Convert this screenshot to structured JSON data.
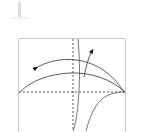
{
  "figure": {
    "name": "phase-plane-trajectory-diagram",
    "background_color": "#ffffff",
    "frame": {
      "stroke": "#c8c8c8",
      "stroke_width": 1,
      "x": 18,
      "y": 38,
      "width": 108,
      "height": 100,
      "note": "bottom edge extends past image crop"
    },
    "axes": {
      "style": "dashed",
      "stroke": "#444444",
      "dash_pattern": "2,2",
      "origin_x": 73,
      "origin_y": 92,
      "x_axis": {
        "label": "",
        "from_x": 19,
        "to_x": 125,
        "y": 92
      },
      "y_axis": {
        "label": "",
        "x": 73,
        "from_y": 39,
        "to_y": 131
      }
    },
    "curves": [
      {
        "name": "upper-arc-leftward",
        "stroke": "#4a4a4a",
        "stroke_width": 0.9,
        "path": "M 124,92 C 110,70 92,62 76,60 C 60,58 46,62 36,68",
        "arrow": {
          "at_x": 34,
          "at_y": 69,
          "angle_deg": 205,
          "direction": "left-down"
        }
      },
      {
        "name": "lower-arc-rightward",
        "stroke": "#4a4a4a",
        "stroke_width": 0.9,
        "path": "M 20,92 C 32,80 50,74 70,73 C 92,72 112,80 125,92",
        "arrow": null
      },
      {
        "name": "rising-branch-to-arrow",
        "stroke": "#4a4a4a",
        "stroke_width": 0.9,
        "path": "M 84,76 C 86,66 88,58 92,51",
        "arrow": {
          "at_x": 93,
          "at_y": 49,
          "angle_deg": 300,
          "direction": "up-right"
        }
      },
      {
        "name": "steep-descending-curve-left",
        "stroke": "#6a6a6a",
        "stroke_width": 0.9,
        "path": "M 78,39 C 80,60 80,84 78,104 C 77,116 75,126 73,131"
      },
      {
        "name": "steep-descending-curve-right",
        "stroke": "#6a6a6a",
        "stroke_width": 0.9,
        "path": "M 125,92 C 112,92 102,96 96,106 C 91,114 88,123 86,131"
      }
    ],
    "arrow_marker": {
      "fill": "#111111",
      "size": 5
    },
    "top_mark": {
      "name": "vertical-tick-mark",
      "color": "#dcdcdc",
      "visible": true
    },
    "annotations": [],
    "tick_labels": [],
    "legend": {
      "visible": false,
      "entries": []
    },
    "title": ""
  }
}
